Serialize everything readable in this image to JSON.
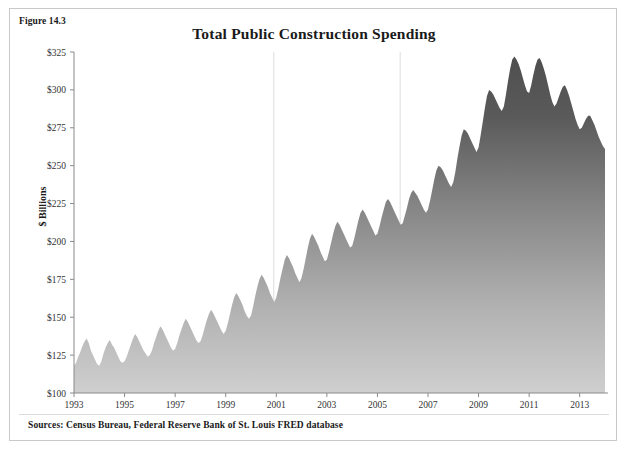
{
  "figure": {
    "label": "Figure 14.3",
    "title": "Total Public Construction Spending",
    "sources": "Sources: Census Bureau, Federal Reserve Bank of St. Louis FRED database"
  },
  "colors": {
    "area_top": "#555555",
    "area_bottom": "#c8c8c8",
    "axis": "#7a7a7a",
    "text": "#1a1a1a",
    "frame": "#c9c9c9",
    "recession_line": "#e2e2e2"
  },
  "chart_data": {
    "type": "area",
    "title": "Total Public Construction Spending",
    "xlabel": "",
    "ylabel": "$ Billions",
    "ylim": [
      100,
      325
    ],
    "xlim": [
      1993.0,
      2014.0
    ],
    "grid": false,
    "legend": "none",
    "ytick_labels": [
      "$100",
      "$125",
      "$150",
      "$175",
      "$200",
      "$225",
      "$250",
      "$275",
      "$300",
      "$325"
    ],
    "ytick_values": [
      100,
      125,
      150,
      175,
      200,
      225,
      250,
      275,
      300,
      325
    ],
    "xtick_labels": [
      "1993",
      "1995",
      "1997",
      "1999",
      "2001",
      "2003",
      "2005",
      "2007",
      "2009",
      "2011",
      "2013"
    ],
    "xtick_values": [
      1993,
      1995,
      1997,
      1999,
      2001,
      2003,
      2005,
      2007,
      2009,
      2011,
      2013
    ],
    "annotations": [
      {
        "name": "recession-2001",
        "x": 2000.9,
        "type": "vertical-line"
      },
      {
        "name": "recession-2008",
        "x": 2005.9,
        "type": "vertical-line"
      }
    ],
    "series": [
      {
        "name": "Total public construction spending",
        "x_start": 1993.0,
        "x_step": 0.08333,
        "units": "$ Billions, monthly",
        "values": [
          118,
          120,
          124,
          127,
          131,
          134,
          136,
          133,
          128,
          125,
          122,
          119,
          118,
          121,
          126,
          130,
          133,
          135,
          132,
          130,
          127,
          124,
          121,
          120,
          121,
          124,
          128,
          132,
          136,
          139,
          137,
          134,
          131,
          128,
          126,
          124,
          125,
          128,
          133,
          137,
          141,
          144,
          142,
          139,
          136,
          133,
          130,
          128,
          129,
          133,
          138,
          142,
          146,
          149,
          147,
          144,
          141,
          138,
          135,
          133,
          134,
          138,
          143,
          148,
          152,
          155,
          153,
          150,
          147,
          144,
          141,
          139,
          141,
          146,
          152,
          158,
          163,
          166,
          164,
          161,
          158,
          154,
          151,
          149,
          151,
          157,
          164,
          170,
          175,
          178,
          176,
          173,
          170,
          166,
          163,
          160,
          163,
          169,
          176,
          182,
          188,
          191,
          189,
          186,
          183,
          179,
          176,
          173,
          176,
          182,
          189,
          196,
          202,
          205,
          203,
          200,
          197,
          193,
          190,
          187,
          188,
          193,
          199,
          205,
          210,
          213,
          211,
          208,
          205,
          202,
          199,
          196,
          197,
          202,
          208,
          214,
          219,
          221,
          219,
          216,
          213,
          210,
          207,
          204,
          205,
          210,
          216,
          221,
          226,
          228,
          226,
          223,
          220,
          217,
          214,
          211,
          212,
          217,
          222,
          228,
          232,
          234,
          232,
          230,
          227,
          224,
          221,
          219,
          221,
          227,
          234,
          241,
          247,
          250,
          249,
          247,
          244,
          241,
          238,
          236,
          239,
          246,
          255,
          263,
          270,
          274,
          273,
          271,
          268,
          265,
          262,
          259,
          262,
          270,
          279,
          288,
          296,
          300,
          299,
          297,
          294,
          291,
          288,
          286,
          289,
          297,
          306,
          314,
          320,
          322,
          320,
          317,
          313,
          308,
          303,
          299,
          298,
          303,
          310,
          316,
          320,
          321,
          318,
          314,
          309,
          303,
          297,
          292,
          289,
          291,
          295,
          299,
          302,
          303,
          300,
          296,
          291,
          286,
          281,
          277,
          274,
          275,
          278,
          281,
          283,
          283,
          280,
          277,
          273,
          269,
          266,
          263,
          261,
          262,
          265,
          268,
          270,
          271,
          269,
          267,
          264,
          262,
          266,
          272
        ]
      }
    ]
  }
}
